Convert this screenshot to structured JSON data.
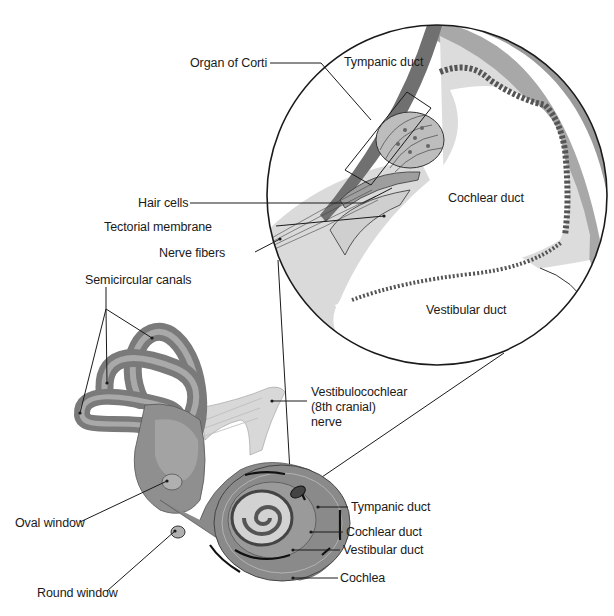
{
  "figure": {
    "colors": {
      "background": "#ffffff",
      "outline": "#1a1a1a",
      "bone_dark": "#6e6e6e",
      "bone_mid": "#8c8c8c",
      "canal_light": "#a9a9a9",
      "membrane_light": "#d4d4d4",
      "tissue_pale": "#e6e6e6",
      "nerve": "#d0d0d0",
      "label_text": "#1a1a1a"
    }
  },
  "magnified_view": {
    "region_labels": {
      "tympanic_duct": "Tympanic duct",
      "cochlear_duct": "Cochlear duct",
      "vestibular_duct": "Vestibular duct"
    },
    "callouts": {
      "organ_of_corti": "Organ of Corti",
      "hair_cells": "Hair cells",
      "tectorial_membrane": "Tectorial membrane",
      "nerve_fibers": "Nerve fibers"
    }
  },
  "inner_ear": {
    "callouts": {
      "semicircular_canals": "Semicircular canals",
      "nerve_line1": "Vestibulocochlear",
      "nerve_line2": "(8th cranial)",
      "nerve_line3": "nerve",
      "oval_window": "Oval window",
      "round_window": "Round window",
      "tympanic_duct": "Tympanic duct",
      "cochlear_duct": "Cochlear duct",
      "vestibular_duct": "Vestibular duct",
      "cochlea": "Cochlea"
    }
  }
}
